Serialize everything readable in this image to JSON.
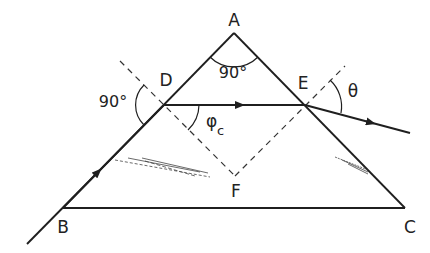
{
  "diagram": {
    "type": "geometric-optics",
    "colors": {
      "line": "#1f1f1f",
      "background": "#ffffff"
    },
    "points": {
      "A": {
        "label": "A",
        "x": 234,
        "y": 33
      },
      "B": {
        "label": "B",
        "x": 63,
        "y": 208
      },
      "C": {
        "label": "C",
        "x": 405,
        "y": 208
      },
      "D": {
        "label": "D",
        "x": 164,
        "y": 105
      },
      "E": {
        "label": "E",
        "x": 305,
        "y": 105
      },
      "F": {
        "label": "F",
        "x": 235,
        "y": 176
      }
    },
    "angles": {
      "apex": "90°",
      "incidence_at_D": "90°",
      "critical": "φ",
      "critical_subscript": "c",
      "exit": "θ"
    },
    "rays": [
      {
        "name": "incident-ray",
        "from": "outside-left",
        "to": "D"
      },
      {
        "name": "internal-ray",
        "from": "D",
        "to": "E"
      },
      {
        "name": "exit-ray",
        "from": "E",
        "to": "outside-right"
      }
    ],
    "normals": [
      "normal-at-D (dashed, through F)",
      "normal-at-E (dashed, through F)"
    ]
  }
}
